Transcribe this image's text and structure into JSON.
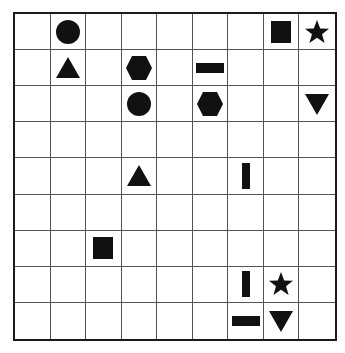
{
  "grid": {
    "rows": 9,
    "cols": 9
  },
  "colors": {
    "shape": "#111111",
    "line": "#555555",
    "border": "#1a1a1a",
    "background": "#ffffff"
  },
  "pieces": [
    {
      "row": 0,
      "col": 1,
      "shape": "circle"
    },
    {
      "row": 0,
      "col": 7,
      "shape": "square"
    },
    {
      "row": 0,
      "col": 8,
      "shape": "star"
    },
    {
      "row": 1,
      "col": 1,
      "shape": "triangle-up"
    },
    {
      "row": 1,
      "col": 3,
      "shape": "hexagon"
    },
    {
      "row": 1,
      "col": 5,
      "shape": "bar-horizontal"
    },
    {
      "row": 2,
      "col": 3,
      "shape": "circle"
    },
    {
      "row": 2,
      "col": 5,
      "shape": "hexagon"
    },
    {
      "row": 2,
      "col": 8,
      "shape": "triangle-down"
    },
    {
      "row": 4,
      "col": 3,
      "shape": "triangle-up"
    },
    {
      "row": 4,
      "col": 6,
      "shape": "bar-vertical"
    },
    {
      "row": 6,
      "col": 2,
      "shape": "square"
    },
    {
      "row": 7,
      "col": 6,
      "shape": "bar-vertical"
    },
    {
      "row": 7,
      "col": 7,
      "shape": "star"
    },
    {
      "row": 8,
      "col": 6,
      "shape": "bar-horizontal"
    },
    {
      "row": 8,
      "col": 7,
      "shape": "triangle-down"
    }
  ]
}
